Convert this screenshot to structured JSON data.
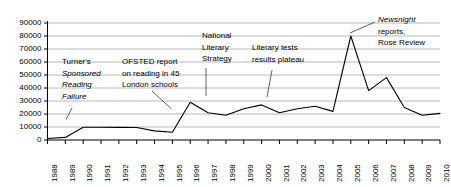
{
  "chart_data": {
    "type": "line",
    "title": "",
    "xlabel": "",
    "ylabel": "",
    "ylim": [
      0,
      90000
    ],
    "ytick_step": 10000,
    "grid": true,
    "legend": "none",
    "line_color": "#000000",
    "grid_color": "#a6a6a6",
    "axis_color": "#000000",
    "ytick_labels": [
      "90000",
      "80000",
      "70000",
      "60000",
      "50000",
      "40000",
      "30000",
      "20000",
      "10000",
      "0"
    ],
    "categories": [
      "1988",
      "1989",
      "1990",
      "1991",
      "1992",
      "1993",
      "1994",
      "1995",
      "1996",
      "1997",
      "1998",
      "1999",
      "2000",
      "2001",
      "2002",
      "2003",
      "2004",
      "2005",
      "2006",
      "2007",
      "2008",
      "2009",
      "2010"
    ],
    "values": [
      1200,
      2000,
      9800,
      9800,
      9700,
      9600,
      7000,
      6000,
      29000,
      21000,
      19000,
      24000,
      27000,
      21000,
      24000,
      26000,
      22000,
      80000,
      38000,
      48000,
      25000,
      19000,
      20500
    ],
    "series": [
      {
        "name": "reading failure coverage",
        "values": [
          1200,
          2000,
          9800,
          9800,
          9700,
          9600,
          7000,
          6000,
          29000,
          21000,
          19000,
          24000,
          27000,
          21000,
          24000,
          26000,
          22000,
          80000,
          38000,
          48000,
          25000,
          19000,
          20500
        ]
      }
    ],
    "annotations": [
      {
        "id": "turners-sponsored-reading-failure",
        "lines": [
          {
            "text": "Turner's",
            "italic": false
          },
          {
            "text": "Sponsored",
            "italic": true
          },
          {
            "text": "Reading",
            "italic": true
          },
          {
            "text": "Failure",
            "italic": true
          }
        ],
        "points_to_year": "1990"
      },
      {
        "id": "ofsted-report",
        "lines": [
          {
            "text": "OFSTED report",
            "italic": false
          },
          {
            "text": "on reading in 45",
            "italic": false
          },
          {
            "text": "London schools",
            "italic": false
          }
        ],
        "points_to_year": "1996"
      },
      {
        "id": "national-literacy-strategy",
        "lines": [
          {
            "text": "National",
            "italic": false
          },
          {
            "text": "Literary",
            "italic": false
          },
          {
            "text": "Strategy",
            "italic": false
          }
        ],
        "points_to_year": "1998"
      },
      {
        "id": "literary-tests-results-plateau",
        "lines": [
          {
            "text": "Literary tests",
            "italic": false
          },
          {
            "text": "results plateau",
            "italic": false
          }
        ],
        "points_to_year": "2001"
      },
      {
        "id": "newsnight-reports-rose-review",
        "lines": [
          {
            "text": "Newsnight",
            "italic": true
          },
          {
            "text": "reports,",
            "italic": false
          },
          {
            "text": "Rose Review",
            "italic": false
          }
        ],
        "points_to_year": "2005"
      }
    ]
  }
}
